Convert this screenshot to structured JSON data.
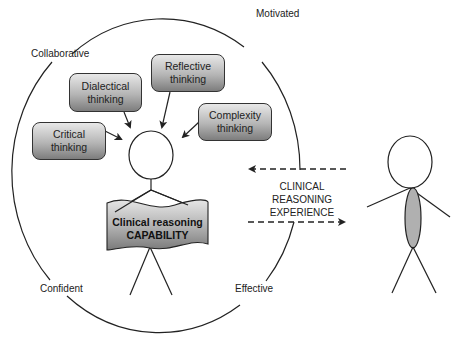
{
  "diagram": {
    "outer_circle_labels": {
      "top_left": "Collaborative",
      "top_right": "Motivated",
      "bottom_left": "Confident",
      "bottom_right": "Effective"
    },
    "thinking_boxes": [
      {
        "id": "critical",
        "line1": "Critical",
        "line2": "thinking"
      },
      {
        "id": "dialectical",
        "line1": "Dialectical",
        "line2": "thinking"
      },
      {
        "id": "reflective",
        "line1": "Reflective",
        "line2": "thinking"
      },
      {
        "id": "complexity",
        "line1": "Complexity",
        "line2": "thinking"
      }
    ],
    "capability_banner": {
      "line1": "Clinical reasoning",
      "line2": "CAPABILITY"
    },
    "experience_label": {
      "line1": "CLINICAL",
      "line2": "REASONING",
      "line3": "EXPERIENCE"
    },
    "colors": {
      "box_top": "#e8e8e8",
      "box_bottom": "#7d7d7d",
      "stroke": "#222222",
      "body_fill": "#b0b0b0"
    }
  }
}
